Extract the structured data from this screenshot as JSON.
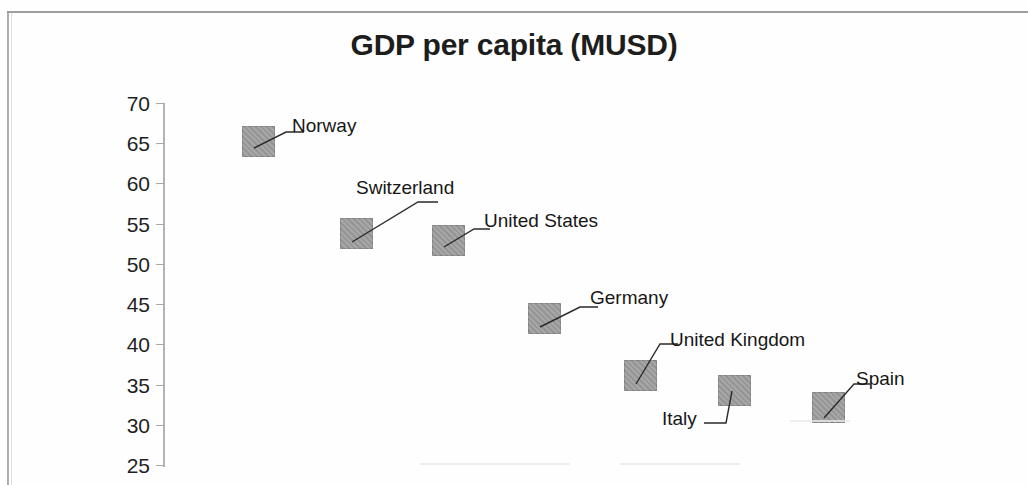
{
  "chart_data": {
    "type": "scatter",
    "title": "GDP per capita (MUSD)",
    "xlabel": "",
    "ylabel": "",
    "ylim": [
      25,
      70
    ],
    "yticks": [
      70,
      65,
      60,
      55,
      50,
      45,
      40,
      35,
      30,
      25
    ],
    "grid": false,
    "legend": "none",
    "marker_color": "#9c9c9c",
    "categories": [
      "Norway",
      "Switzerland",
      "United States",
      "Germany",
      "United Kingdom",
      "Italy",
      "Spain"
    ],
    "values": [
      65,
      54,
      53,
      43,
      36,
      34,
      32
    ],
    "points": [
      {
        "label": "Norway",
        "value": 65,
        "x_px": 242,
        "y_px": 126,
        "label_x": 292,
        "label_y": 116,
        "leader": "M 12,22 L 44,6 L 62,6"
      },
      {
        "label": "Switzerland",
        "value": 54,
        "x_px": 340,
        "y_px": 218,
        "label_x": 356,
        "label_y": 178,
        "leader": "M 12,24 L 78,-16 L 98,-16"
      },
      {
        "label": "United States",
        "value": 53,
        "x_px": 432,
        "y_px": 225,
        "label_x": 484,
        "label_y": 211,
        "leader": "M 12,22 L 42,4 L 58,4"
      },
      {
        "label": "Germany",
        "value": 43,
        "x_px": 528,
        "y_px": 303,
        "label_x": 590,
        "label_y": 288,
        "leader": "M 12,24 L 52,4 L 70,4"
      },
      {
        "label": "United Kingdom",
        "value": 36,
        "x_px": 624,
        "y_px": 360,
        "label_x": 670,
        "label_y": 330,
        "leader": "M 12,24 L 36,-16 L 54,-16"
      },
      {
        "label": "Italy",
        "value": 34,
        "x_px": 718,
        "y_px": 375,
        "label_x": 662,
        "label_y": 409,
        "leader": "M 14,16 L 8,48 L -14,48"
      },
      {
        "label": "Spain",
        "value": 32,
        "x_px": 812,
        "y_px": 392,
        "label_x": 856,
        "label_y": 369,
        "leader": "M 12,26 L 42,-8 L 58,-8"
      }
    ]
  }
}
